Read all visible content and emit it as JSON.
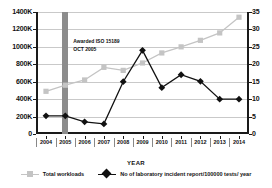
{
  "chart_data": {
    "type": "line",
    "title": "",
    "xlabel": "YEAR",
    "ylabel_left": "",
    "ylabel_right": "",
    "categories": [
      "2004",
      "2005",
      "2006",
      "2007",
      "2008",
      "2009",
      "2010",
      "2011",
      "2012",
      "2013",
      "2014"
    ],
    "grid": true,
    "legend_position": "bottom",
    "axes": {
      "left": {
        "ticks": [
          "0",
          "200K",
          "400K",
          "600K",
          "800K",
          "1000K",
          "1200K",
          "1400K"
        ],
        "values": [
          0,
          200000,
          400000,
          600000,
          800000,
          1000000,
          1200000,
          1400000
        ],
        "ylim": [
          0,
          1400000
        ]
      },
      "right": {
        "ticks": [
          "0",
          "5",
          "10",
          "15",
          "20",
          "25",
          "30",
          "35"
        ],
        "values": [
          0,
          5,
          10,
          15,
          20,
          25,
          30,
          35
        ],
        "ylim": [
          0,
          35
        ]
      }
    },
    "series": [
      {
        "name": "Total workloads",
        "axis": "left",
        "marker": "square",
        "color": "#c4c4c4",
        "values": [
          490000,
          560000,
          620000,
          765000,
          730000,
          815000,
          930000,
          1000000,
          1075000,
          1160000,
          1340000
        ]
      },
      {
        "name": "No of laboratory incident report/100000 tests/ year",
        "axis": "right",
        "marker": "diamond",
        "color": "#111111",
        "values": [
          5.2,
          5.2,
          3.5,
          2.9,
          15.0,
          24.0,
          13.3,
          17.0,
          15.1,
          10.0,
          10.0
        ]
      }
    ],
    "annotations": [
      {
        "name": "iso-accreditation",
        "line1": "Awarded ISO 15189",
        "line2": "OCT 2005",
        "at_category": "2005",
        "band_color": "#8c8c8c"
      }
    ]
  },
  "legend": {
    "items": [
      {
        "label": "Total workloads",
        "marker": "square",
        "color": "#c4c4c4"
      },
      {
        "label": "No of laboratory incident report/100000 tests/ year",
        "marker": "diamond",
        "color": "#111111"
      }
    ]
  },
  "axis_title": {
    "x": "YEAR"
  }
}
